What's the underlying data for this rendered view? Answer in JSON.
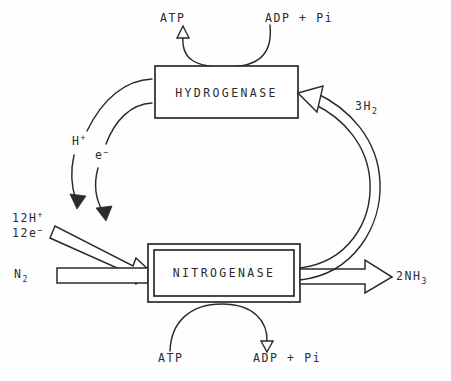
{
  "diagram": {
    "nodes": {
      "hydrogenase": {
        "label": "HYDROGENASE"
      },
      "nitrogenase": {
        "label": "NITROGENASE"
      }
    },
    "labels": {
      "atp_top": "ATP",
      "adp_pi_top": "ADP + Pi",
      "atp_bottom": "ATP",
      "adp_pi_bottom": "ADP + Pi",
      "proton": "H",
      "proton_charge": "+",
      "electron": "e",
      "electron_charge": "−",
      "twelve_protons": "12H",
      "twelve_protons_charge": "+",
      "twelve_electrons": "12e",
      "twelve_electrons_charge": "−",
      "dinitrogen": "N",
      "dinitrogen_sub": "2",
      "hydrogen_gas": "3H",
      "hydrogen_gas_sub": "2",
      "ammonia": "2NH",
      "ammonia_sub": "3"
    },
    "colors": {
      "ink": "#2b2b2b",
      "paper": "#ffffff"
    }
  }
}
